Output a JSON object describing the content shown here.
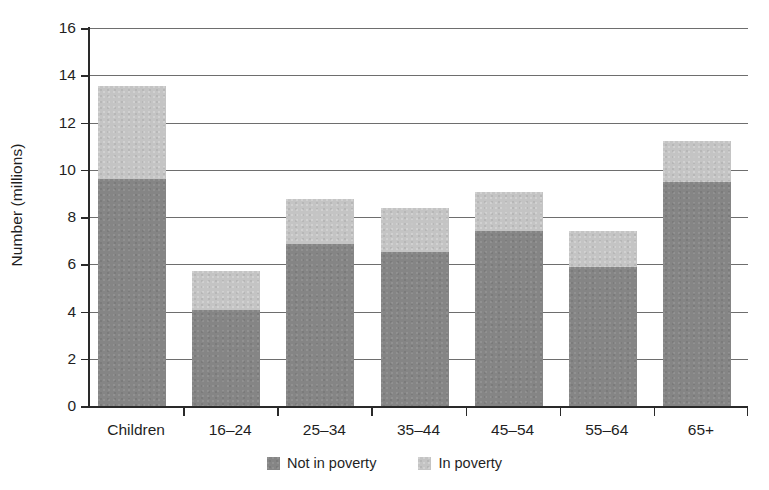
{
  "chart_data": {
    "type": "bar",
    "subtype": "stacked",
    "title": "",
    "xlabel": "",
    "ylabel": "Number (millions)",
    "ylim": [
      0,
      16
    ],
    "ytick_step": 2,
    "yticks": [
      16,
      14,
      12,
      10,
      8,
      6,
      4,
      2,
      0
    ],
    "grid": true,
    "legend_position": "bottom-center",
    "categories": [
      "Children",
      "16–24",
      "25–34",
      "35–44",
      "45–54",
      "55–64",
      "65+"
    ],
    "series": [
      {
        "name": "Not in poverty",
        "color": "#858585",
        "values": [
          9.6,
          4.05,
          6.85,
          6.5,
          7.4,
          5.9,
          9.5
        ]
      },
      {
        "name": "In poverty",
        "color": "#c4c4c4",
        "values": [
          3.95,
          1.65,
          1.9,
          1.9,
          1.65,
          1.5,
          1.7
        ]
      }
    ],
    "totals": [
      13.55,
      5.7,
      8.75,
      8.4,
      9.05,
      7.4,
      11.2
    ]
  },
  "axis": {
    "y_title": "Number (millions)",
    "y_tick_labels": [
      "16",
      "14",
      "12",
      "10",
      "8",
      "6",
      "4",
      "2",
      "0"
    ],
    "x_tick_labels": [
      "Children",
      "16–24",
      "25–34",
      "35–44",
      "45–54",
      "55–64",
      "65+"
    ]
  },
  "legend": {
    "items": [
      {
        "label": "Not in poverty",
        "color": "#858585"
      },
      {
        "label": "In poverty",
        "color": "#c4c4c4"
      }
    ]
  },
  "colors": {
    "not_in_poverty": "#858585",
    "in_poverty": "#c4c4c4",
    "axis": "#2a2a2a",
    "grid": "#6e6e6e",
    "background": "#ffffff"
  }
}
